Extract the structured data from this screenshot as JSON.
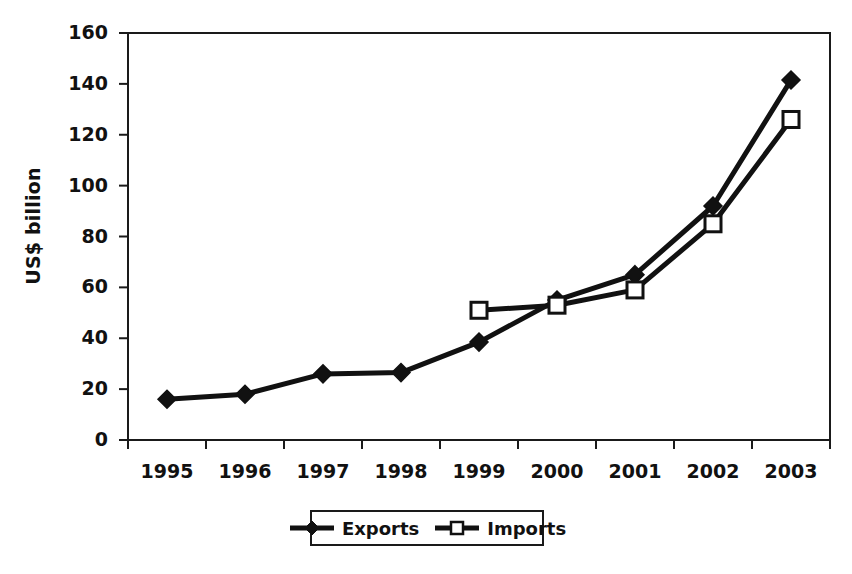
{
  "chart_data": {
    "type": "line",
    "title": "",
    "xlabel": "",
    "ylabel": "US$ billion",
    "categories": [
      "1995",
      "1996",
      "1997",
      "1998",
      "1999",
      "2000",
      "2001",
      "2002",
      "2003"
    ],
    "ylim": [
      0,
      160
    ],
    "ytick_values": [
      0,
      20,
      40,
      60,
      80,
      100,
      120,
      140,
      160
    ],
    "ytick_labels": [
      "0",
      "20",
      "40",
      "60",
      "80",
      "100",
      "120",
      "140",
      "160"
    ],
    "grid": false,
    "legend_position": "bottom-center",
    "series": [
      {
        "name": "Exports",
        "marker": "filled-diamond",
        "color": "#111111",
        "values": [
          16,
          18,
          26,
          26.5,
          38.5,
          55,
          65,
          92,
          141.5
        ]
      },
      {
        "name": "Imports",
        "marker": "open-square",
        "color": "#111111",
        "values": [
          null,
          null,
          null,
          null,
          51,
          53,
          59,
          85,
          126
        ]
      }
    ]
  },
  "legend": {
    "entries": [
      {
        "label": "Exports"
      },
      {
        "label": "Imports"
      }
    ]
  },
  "colors": {
    "line": "#111111",
    "axis": "#1a1a1a",
    "background": "#ffffff"
  }
}
